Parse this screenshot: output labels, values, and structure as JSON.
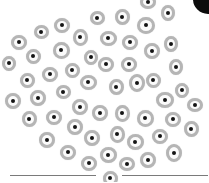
{
  "image": {
    "description": "Microscopy-style illustration of many round cells, each with a grey membrane ring and a dark nucleus, arranged in an inverted-triangle cluster above a thin horizontal line",
    "width": 209,
    "height": 182,
    "colors": {
      "background": "#ffffff",
      "membrane": "#b5b5b5",
      "nucleus": "#141414",
      "blob": "#0c0c0c",
      "line": "#7a7a7a"
    },
    "cells": [
      [
        148,
        2,
        16,
        14
      ],
      [
        168,
        13,
        14,
        16
      ],
      [
        122,
        17,
        15,
        16
      ],
      [
        97,
        18,
        15,
        14
      ],
      [
        146,
        25,
        18,
        17
      ],
      [
        62,
        25,
        16,
        15
      ],
      [
        41,
        32,
        15,
        14
      ],
      [
        80,
        37,
        15,
        17
      ],
      [
        108,
        38,
        17,
        15
      ],
      [
        19,
        42,
        16,
        15
      ],
      [
        130,
        42,
        16,
        15
      ],
      [
        171,
        44,
        14,
        16
      ],
      [
        61,
        50,
        17,
        17
      ],
      [
        152,
        51,
        16,
        16
      ],
      [
        33,
        56,
        15,
        15
      ],
      [
        91,
        57,
        14,
        15
      ],
      [
        9,
        63,
        14,
        15
      ],
      [
        106,
        64,
        16,
        15
      ],
      [
        129,
        64,
        16,
        15
      ],
      [
        176,
        67,
        14,
        16
      ],
      [
        50,
        74,
        16,
        15
      ],
      [
        72,
        70,
        15,
        15
      ],
      [
        27,
        80,
        15,
        15
      ],
      [
        88,
        82,
        17,
        15
      ],
      [
        116,
        87,
        15,
        16
      ],
      [
        137,
        83,
        16,
        18
      ],
      [
        153,
        80,
        15,
        15
      ],
      [
        182,
        90,
        14,
        15
      ],
      [
        13,
        101,
        16,
        16
      ],
      [
        38,
        98,
        16,
        16
      ],
      [
        63,
        92,
        15,
        14
      ],
      [
        80,
        107,
        16,
        16
      ],
      [
        100,
        113,
        16,
        16
      ],
      [
        122,
        113,
        15,
        17
      ],
      [
        165,
        100,
        18,
        16
      ],
      [
        195,
        105,
        16,
        14
      ],
      [
        29,
        119,
        15,
        16
      ],
      [
        54,
        117,
        16,
        15
      ],
      [
        75,
        127,
        16,
        16
      ],
      [
        145,
        118,
        17,
        17
      ],
      [
        173,
        119,
        16,
        15
      ],
      [
        191,
        129,
        15,
        16
      ],
      [
        47,
        140,
        16,
        16
      ],
      [
        92,
        138,
        16,
        16
      ],
      [
        117,
        134,
        15,
        17
      ],
      [
        135,
        142,
        17,
        16
      ],
      [
        160,
        136,
        16,
        15
      ],
      [
        68,
        152,
        16,
        15
      ],
      [
        108,
        155,
        17,
        16
      ],
      [
        174,
        153,
        16,
        18
      ],
      [
        89,
        163,
        16,
        15
      ],
      [
        127,
        164,
        16,
        14
      ],
      [
        148,
        160,
        16,
        16
      ],
      [
        110,
        178,
        15,
        15
      ]
    ],
    "baseline": {
      "segments": [
        [
          10,
          96
        ],
        [
          122,
          208
        ]
      ]
    }
  }
}
